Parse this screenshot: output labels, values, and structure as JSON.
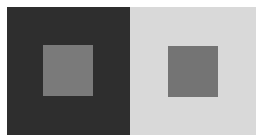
{
  "figure": {
    "left_panel": {
      "background": "#2e2e2e",
      "square_color": "#7a7a7a"
    },
    "right_panel": {
      "background": "#d9d9d9",
      "square_color": "#747474"
    }
  }
}
